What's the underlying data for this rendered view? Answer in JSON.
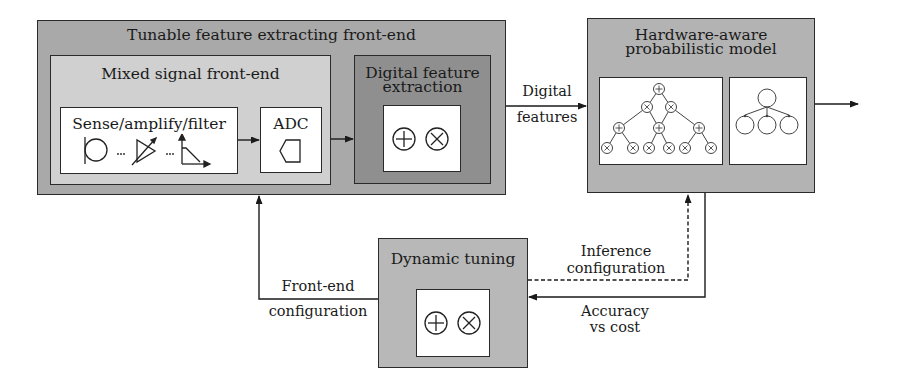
{
  "frontend": {
    "title": "Tunable feature extracting front-end",
    "mixed_signal": {
      "title": "Mixed signal front-end",
      "sense_block": {
        "title": "Sense/amplify/filter",
        "icons": [
          "sensor-icon",
          "ellipsis",
          "tunable-amplifier-icon",
          "ellipsis",
          "filter-response-icon"
        ]
      },
      "adc_block": {
        "title": "ADC",
        "icons": [
          "adc-pentagon-icon"
        ]
      }
    },
    "digital_feature": {
      "title_line1": "Digital feature",
      "title_line2": "extraction",
      "icons": [
        "plus-circle-icon",
        "times-circle-icon"
      ]
    }
  },
  "edge_labels": {
    "digital_features_line1": "Digital",
    "digital_features_line2": "features",
    "frontend_config_line1": "Front-end",
    "frontend_config_line2": "configuration",
    "inference_config_line1": "Inference",
    "inference_config_line2": "configuration",
    "accuracy_line1": "Accuracy",
    "accuracy_line2": "vs cost"
  },
  "model": {
    "title_line1": "Hardware-aware",
    "title_line2": "probabilistic model",
    "panels": [
      "sum-product-network-tree-icon",
      "bayesian-network-icon"
    ]
  },
  "tuning": {
    "title": "Dynamic tuning",
    "icons": [
      "plus-circle-icon",
      "times-circle-icon"
    ]
  }
}
